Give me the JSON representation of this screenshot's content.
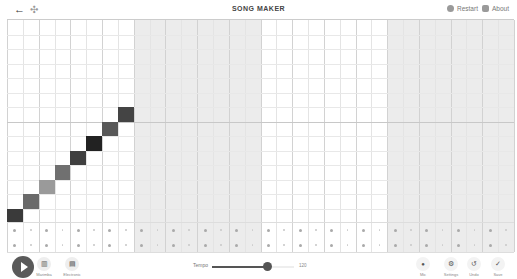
{
  "header": {
    "title": "SONG MAKER",
    "back_icon": "←",
    "move_icon": "✣",
    "restart_label": "Restart",
    "about_label": "About"
  },
  "grid": {
    "columns": 32,
    "rows": 14,
    "beats_per_bar": 2,
    "subdivisions": 4,
    "shaded_bars": [
      1,
      3
    ],
    "notes": [
      {
        "col": 0,
        "row": 13,
        "color": "#3a3a3a"
      },
      {
        "col": 1,
        "row": 12,
        "color": "#6a6a6a"
      },
      {
        "col": 2,
        "row": 11,
        "color": "#9a9a9a"
      },
      {
        "col": 3,
        "row": 10,
        "color": "#707070"
      },
      {
        "col": 4,
        "row": 9,
        "color": "#404040"
      },
      {
        "col": 5,
        "row": 8,
        "color": "#222222"
      },
      {
        "col": 6,
        "row": 7,
        "color": "#585858"
      },
      {
        "col": 7,
        "row": 6,
        "color": "#444444"
      }
    ]
  },
  "toolbar": {
    "play_icon": "play",
    "instrument_label": "Marimba",
    "percussion_label": "Electronic",
    "instrument_icon": "▥",
    "percussion_icon": "▤",
    "tempo_label": "Tempo",
    "tempo_value": "120",
    "tempo_fill_pct": 68,
    "mic_label": "Mic",
    "settings_label": "Settings",
    "undo_label": "Undo",
    "save_label": "Save",
    "mic_icon": "🎙",
    "settings_icon": "⚙",
    "undo_icon": "↺",
    "save_icon": "✓"
  }
}
